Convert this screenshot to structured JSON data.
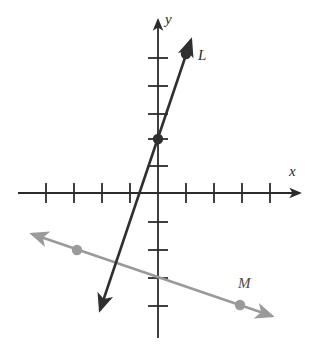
{
  "figure": {
    "type": "coordinate-plane-two-lines",
    "background_color": "#ffffff",
    "axis_color": "#2b2b2b",
    "line_L_color": "#2f2f2f",
    "line_M_color": "#9a9a9a",
    "point_L_color": "#2f2f2f",
    "point_M_color": "#9a9a9a"
  },
  "axes": {
    "x_label": "x",
    "y_label": "y",
    "origin_px": {
      "x": 158,
      "y": 193
    },
    "unit_px": 28,
    "x_axis": {
      "start_px": {
        "x": 18,
        "y": 193
      },
      "end_px": {
        "x": 302,
        "y": 193
      },
      "arrow": "right",
      "tick_positions_units": [
        -4,
        -3,
        -2,
        -1,
        1,
        2,
        3,
        4
      ],
      "tick_positions_px": [
        46,
        74,
        102,
        130,
        186,
        214,
        242,
        270
      ],
      "tick_half_length_px": 10
    },
    "y_axis": {
      "start_px": {
        "x": 158,
        "y": 18
      },
      "end_px": {
        "x": 158,
        "y": 338
      },
      "arrow": "up",
      "tick_positions_units": [
        5,
        4,
        3,
        2,
        1,
        -1,
        -2,
        -3,
        -4
      ],
      "tick_positions_px": [
        58,
        86,
        114,
        139,
        166,
        222,
        250,
        278,
        306
      ],
      "tick_half_length_px": 10
    }
  },
  "lines": [
    {
      "name": "L",
      "label": "L",
      "color": "#2f2f2f",
      "stroke_width": 2.4,
      "arrows": "both",
      "start_px": {
        "x": 96,
        "y": 322
      },
      "end_px": {
        "x": 194,
        "y": 32
      },
      "points": [
        {
          "label": "",
          "units": [
            0,
            2
          ],
          "px": {
            "x": 158,
            "y": 139
          }
        },
        {
          "label": "L",
          "units": [
            1,
            5
          ],
          "px": {
            "x": 186,
            "y": 54
          }
        }
      ],
      "slope_units": 3,
      "y_intercept_units": 2
    },
    {
      "name": "M",
      "label": "M",
      "color": "#9a9a9a",
      "stroke_width": 2.4,
      "arrows": "both",
      "start_px": {
        "x": 28,
        "y": 233
      },
      "end_px": {
        "x": 277,
        "y": 318
      },
      "points": [
        {
          "label": "",
          "units": [
            -3,
            -2
          ],
          "px": {
            "x": 77,
            "y": 250
          }
        },
        {
          "label": "M",
          "units": [
            3,
            -4
          ],
          "px": {
            "x": 240,
            "y": 305
          }
        }
      ],
      "slope_units": -0.3333,
      "y_intercept_units": -3
    }
  ],
  "labels": {
    "x": "x",
    "y": "y",
    "L": "L",
    "M": "M"
  }
}
